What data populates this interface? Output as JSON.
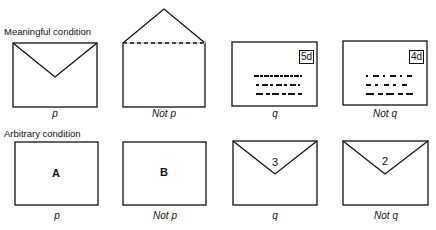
{
  "rows": [
    {
      "title": "Meaningful condition",
      "cards": [
        {
          "label": "p",
          "content": "sealed envelope back"
        },
        {
          "label": "Not p",
          "content": "unsealed envelope, open flap"
        },
        {
          "label": "q",
          "content": "envelope front with address",
          "stamp": "5d"
        },
        {
          "label": "Not q",
          "content": "envelope front with address",
          "stamp": "4d"
        }
      ]
    },
    {
      "title": "Arbitrary condition",
      "cards": [
        {
          "label": "p",
          "letter": "A"
        },
        {
          "label": "Not p",
          "letter": "B"
        },
        {
          "label": "q",
          "number": "3"
        },
        {
          "label": "Not q",
          "number": "2"
        }
      ]
    }
  ]
}
